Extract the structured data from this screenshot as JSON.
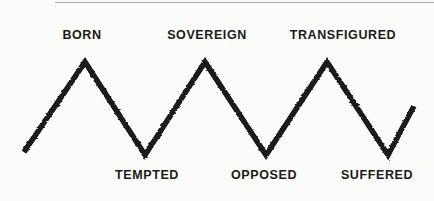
{
  "figure": {
    "type": "zigzag-line-diagram",
    "background_color": "#fbfbf9",
    "line_color": "#141414",
    "label_color": "#1a1a1a",
    "rule_color": "#9a9a9a"
  },
  "chart_data": {
    "type": "line",
    "title": "",
    "xlabel": "",
    "ylabel": "",
    "grid": false,
    "legend": null,
    "xlim": [
      0,
      434
    ],
    "ylim": [
      201,
      0
    ],
    "annotations": [
      {
        "text": "BORN",
        "position": "above",
        "x": 82,
        "y": 62,
        "label_x": 82,
        "label_y": 35
      },
      {
        "text": "TEMPTED",
        "position": "below",
        "x": 145,
        "y": 155,
        "label_x": 147,
        "label_y": 176
      },
      {
        "text": "SOVEREIGN",
        "position": "above",
        "x": 205,
        "y": 62,
        "label_x": 207,
        "label_y": 35
      },
      {
        "text": "OPPOSED",
        "position": "below",
        "x": 266,
        "y": 155,
        "label_x": 264,
        "label_y": 176
      },
      {
        "text": "TRANSFIGURED",
        "position": "above",
        "x": 327,
        "y": 62,
        "label_x": 343,
        "label_y": 35
      },
      {
        "text": "SUFFERED",
        "position": "below",
        "x": 388,
        "y": 155,
        "label_x": 377,
        "label_y": 176
      }
    ],
    "x": [
      24,
      85,
      145,
      205,
      266,
      327,
      388,
      414
    ],
    "values": [
      152,
      62,
      155,
      62,
      155,
      62,
      155,
      106
    ],
    "points": [
      {
        "x": 24,
        "y": 152,
        "kind": "start"
      },
      {
        "x": 85,
        "y": 62,
        "kind": "peak",
        "label": "BORN"
      },
      {
        "x": 145,
        "y": 155,
        "kind": "valley",
        "label": "TEMPTED"
      },
      {
        "x": 205,
        "y": 62,
        "kind": "peak",
        "label": "SOVEREIGN"
      },
      {
        "x": 266,
        "y": 155,
        "kind": "valley",
        "label": "OPPOSED"
      },
      {
        "x": 327,
        "y": 62,
        "kind": "peak",
        "label": "TRANSFIGURED"
      },
      {
        "x": 388,
        "y": 155,
        "kind": "valley",
        "label": "SUFFERED"
      },
      {
        "x": 414,
        "y": 106,
        "kind": "end"
      }
    ]
  },
  "labels": {
    "peaks": [
      {
        "text": "BORN",
        "x": 82,
        "y": 29
      },
      {
        "text": "SOVEREIGN",
        "x": 207,
        "y": 29
      },
      {
        "text": "TRANSFIGURED",
        "x": 343,
        "y": 29
      }
    ],
    "valleys": [
      {
        "text": "TEMPTED",
        "x": 147,
        "y": 169
      },
      {
        "text": "OPPOSED",
        "x": 264,
        "y": 169
      },
      {
        "text": "SUFFERED",
        "x": 377,
        "y": 169
      }
    ]
  }
}
